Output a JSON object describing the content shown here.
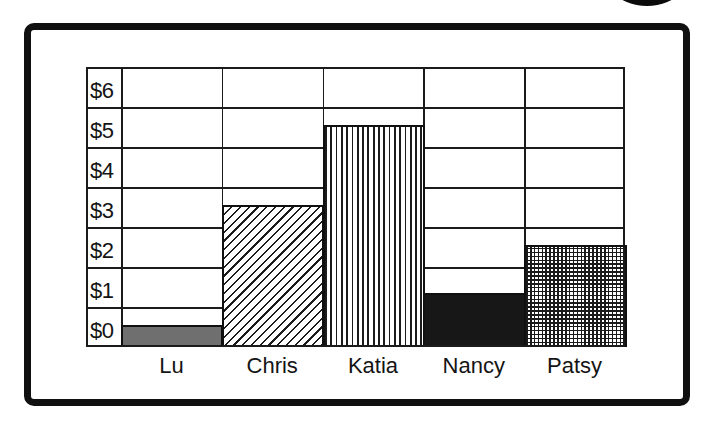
{
  "page": {
    "badge": "page-number-bubble-partial"
  },
  "chart_data": {
    "type": "bar",
    "title": "",
    "xlabel": "",
    "ylabel": "",
    "categories": [
      "Lu",
      "Chris",
      "Katia",
      "Nancy",
      "Patsy"
    ],
    "values": [
      0.5,
      3.5,
      5.5,
      1.3,
      2.5
    ],
    "y_tick_labels": [
      "$0",
      "$1",
      "$2",
      "$3",
      "$4",
      "$5",
      "$6"
    ],
    "ylim": [
      0,
      7
    ],
    "grid": true,
    "legend": false,
    "bar_patterns": [
      "solid-gray",
      "diagonal-hatch",
      "vertical-stripes",
      "solid-black",
      "crosshatch"
    ],
    "colors": {
      "bar_gray": "#6f6f6f",
      "bar_black": "#171717",
      "pattern_line": "#1b1b1b",
      "gridline": "#1b1b1b",
      "frame": "#101010",
      "background": "#ffffff"
    }
  }
}
